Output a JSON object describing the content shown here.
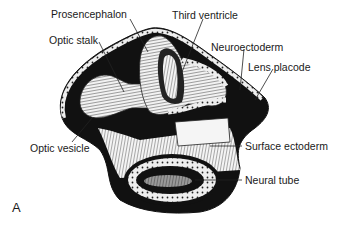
{
  "figure": {
    "panel_label": "A",
    "labels": [
      {
        "id": "prosencephalon",
        "text": "Prosencephalon"
      },
      {
        "id": "third-ventricle",
        "text": "Third ventricle"
      },
      {
        "id": "optic-stalk",
        "text": "Optic stalk"
      },
      {
        "id": "neuroectoderm",
        "text": "Neuroectoderm"
      },
      {
        "id": "lens-placode",
        "text": "Lens placode"
      },
      {
        "id": "optic-vesicle",
        "text": "Optic vesicle"
      },
      {
        "id": "surface-ectoderm",
        "text": "Surface ectoderm"
      },
      {
        "id": "neural-tube",
        "text": "Neural tube"
      }
    ]
  }
}
